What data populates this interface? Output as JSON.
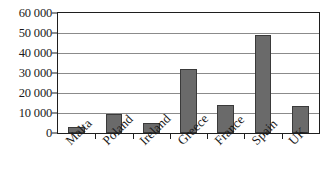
{
  "chart_data": {
    "type": "bar",
    "title": "",
    "subtitle": "",
    "xlabel": "",
    "ylabel": "",
    "categories": [
      "Malta",
      "Poland",
      "Ireland",
      "Greece",
      "France",
      "Spain",
      "UK"
    ],
    "values": [
      3000,
      9500,
      5000,
      32000,
      14000,
      49000,
      13500
    ],
    "ylim": [
      0,
      60000
    ],
    "ytick_values": [
      0,
      10000,
      20000,
      30000,
      40000,
      50000,
      60000
    ],
    "ytick_labels": [
      "0",
      "10 000",
      "20 000",
      "30 000",
      "40 000",
      "50 000",
      "60 000"
    ],
    "grid": "horizontal",
    "legend": "none",
    "series": [
      {
        "name": "",
        "values": [
          3000,
          9500,
          5000,
          32000,
          14000,
          49000,
          13500
        ]
      }
    ],
    "colors": {
      "bar_fill": "#6a6a6a",
      "bar_stroke": "#3a3a3a",
      "gridline": "#8b8b8b",
      "axis": "#1e1e1e",
      "background": "#ffffff"
    }
  }
}
